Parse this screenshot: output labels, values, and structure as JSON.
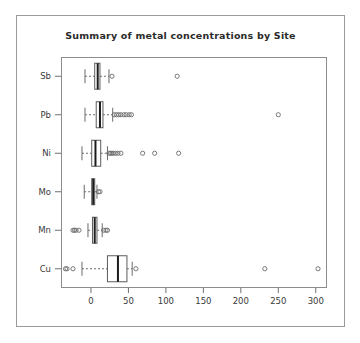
{
  "window": {
    "background_color": "#ffffff",
    "frame_color": "#9a9a9a"
  },
  "chart_data": {
    "type": "boxplot",
    "orientation": "horizontal",
    "title": "Summary of metal concentrations by Site",
    "xlabel": "",
    "ylabel": "",
    "grid": false,
    "legend": "none",
    "xlim": [
      -40,
      315
    ],
    "xticks": [
      0,
      50,
      100,
      150,
      200,
      250,
      300
    ],
    "xticklabels": [
      "0",
      "50",
      "100",
      "150",
      "200",
      "250",
      "300"
    ],
    "categories": [
      "Cu",
      "Mn",
      "Mo",
      "Ni",
      "Pb",
      "Sb"
    ],
    "category_order_top_to_bottom": [
      "Sb",
      "Pb",
      "Ni",
      "Mo",
      "Mn",
      "Cu"
    ],
    "boxes": [
      {
        "name": "Sb",
        "whisker_low": -8,
        "q1": 5,
        "median": 9,
        "q3": 12,
        "whisker_high": 24,
        "outliers": [
          28,
          115
        ]
      },
      {
        "name": "Pb",
        "whisker_low": -8,
        "q1": 7,
        "median": 12,
        "q3": 16,
        "whisker_high": 29,
        "outliers": [
          31,
          34,
          37,
          40,
          44,
          47,
          51,
          54,
          250
        ]
      },
      {
        "name": "Ni",
        "whisker_low": -12,
        "q1": 1,
        "median": 6,
        "q3": 13,
        "whisker_high": 22,
        "outliers": [
          24,
          26,
          28,
          30,
          33,
          36,
          40,
          69,
          85,
          117
        ]
      },
      {
        "name": "Mo",
        "whisker_low": -9,
        "q1": 1,
        "median": 3,
        "q3": 5,
        "whisker_high": 8,
        "outliers": [
          10,
          12
        ]
      },
      {
        "name": "Mn",
        "whisker_low": -4,
        "q1": 2,
        "median": 5,
        "q3": 8,
        "whisker_high": 15,
        "outliers": [
          -24,
          -22,
          -20,
          -16,
          17,
          20,
          22
        ]
      },
      {
        "name": "Cu",
        "whisker_low": -12,
        "q1": 22,
        "median": 36,
        "q3": 48,
        "whisker_high": 55,
        "outliers": [
          -34,
          -32,
          -24,
          60,
          232,
          303
        ]
      }
    ],
    "colors": {
      "box_fill": "#ffffff",
      "box_stroke": "#5c5c5c",
      "median": "#1c1c1c",
      "whisker": "#6b6b6b",
      "outlier": "#6b6b6b",
      "axis": "#6f6f6f",
      "text": "#3a3a3a"
    }
  }
}
